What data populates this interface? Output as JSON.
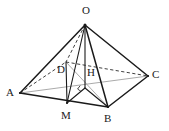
{
  "figure": {
    "type": "geometry-diagram",
    "background_color": "#ffffff",
    "stroke_color": "#1a1a1a",
    "light_stroke_color": "#9a9a9a",
    "labels": [
      {
        "id": "O",
        "text": "O",
        "x": 82,
        "y": 7
      },
      {
        "id": "D",
        "text": "D",
        "x": 57,
        "y": 65
      },
      {
        "id": "H",
        "text": "H",
        "x": 86,
        "y": 68
      },
      {
        "id": "C",
        "text": "C",
        "x": 152,
        "y": 70
      },
      {
        "id": "A",
        "text": "A",
        "x": 7,
        "y": 88
      },
      {
        "id": "M",
        "text": "M",
        "x": 62,
        "y": 113
      },
      {
        "id": "B",
        "text": "B",
        "x": 104,
        "y": 115
      }
    ],
    "points": {
      "O": {
        "x": 85,
        "y": 25
      },
      "A": {
        "x": 20,
        "y": 93
      },
      "B": {
        "x": 108,
        "y": 107
      },
      "C": {
        "x": 148,
        "y": 76
      },
      "D": {
        "x": 66,
        "y": 62
      },
      "M": {
        "x": 67,
        "y": 103
      },
      "H": {
        "x": 85,
        "y": 88
      }
    },
    "edges_solid": [
      {
        "name": "edge-OA",
        "from": "O",
        "to": "A"
      },
      {
        "name": "edge-OB",
        "from": "O",
        "to": "B"
      },
      {
        "name": "edge-OC",
        "from": "O",
        "to": "C"
      },
      {
        "name": "edge-AB",
        "from": "A",
        "to": "B"
      },
      {
        "name": "edge-BC",
        "from": "B",
        "to": "C"
      },
      {
        "name": "edge-OM",
        "from": "O",
        "to": "M"
      },
      {
        "name": "edge-OH",
        "from": "O",
        "to": "H"
      },
      {
        "name": "edge-MH",
        "from": "M",
        "to": "H"
      },
      {
        "name": "edge-MD",
        "from": "M",
        "to": "D"
      },
      {
        "name": "edge-HB",
        "from": "H",
        "to": "B"
      }
    ],
    "edges_dashed": [
      {
        "name": "edge-OD",
        "from": "O",
        "to": "D"
      },
      {
        "name": "edge-AD",
        "from": "A",
        "to": "D"
      },
      {
        "name": "edge-DC",
        "from": "D",
        "to": "C"
      }
    ],
    "edges_light": [
      {
        "name": "diagonal-AC",
        "from": "A",
        "to": "C"
      },
      {
        "name": "diagonal-DB",
        "from": "D",
        "to": "B"
      }
    ],
    "right_angle_mark": {
      "name": "right-angle-at-H",
      "x": 85,
      "y": 88
    }
  }
}
